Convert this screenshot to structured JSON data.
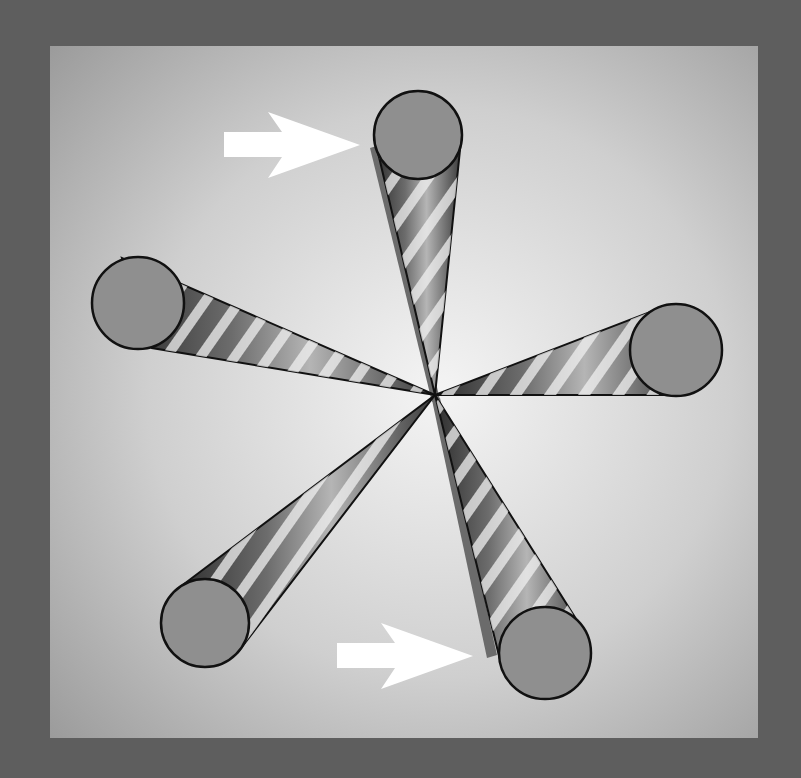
{
  "figure": {
    "title": "",
    "colors": {
      "outer_frame": "#5e5e5e",
      "panel_center": "#f2f2f2",
      "panel_edge": "#9c9c9c",
      "cone_base_fill": "#8f8f8f",
      "cone_outline": "#111111",
      "stripe_light": "#e8e8e8",
      "stripe_dark": "#4a4a4a",
      "shadow": "#6b6b6b",
      "arrow": "#ffffff"
    },
    "panel": {
      "x": 50,
      "y": 46,
      "width": 708,
      "height": 692
    },
    "apex": {
      "x": 435,
      "y": 395
    },
    "cones": [
      {
        "name": "cone-top",
        "cx": 418,
        "cy": 135,
        "r": 44
      },
      {
        "name": "cone-left",
        "cx": 138,
        "cy": 303,
        "r": 46
      },
      {
        "name": "cone-right",
        "cx": 676,
        "cy": 350,
        "r": 46
      },
      {
        "name": "cone-bottom-left",
        "cx": 205,
        "cy": 623,
        "r": 44
      },
      {
        "name": "cone-bottom-right",
        "cx": 545,
        "cy": 653,
        "r": 46
      }
    ],
    "arrows": [
      {
        "name": "arrow-top",
        "tip_x": 360,
        "tip_y": 142,
        "tail_x": 224,
        "label": ""
      },
      {
        "name": "arrow-bottom",
        "tip_x": 473,
        "tip_y": 655,
        "tail_x": 337,
        "label": ""
      }
    ]
  }
}
